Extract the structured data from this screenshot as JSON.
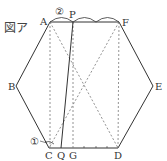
{
  "figure": {
    "title": "図ア",
    "points": {
      "A": "A",
      "B": "B",
      "C": "C",
      "D": "D",
      "E": "E",
      "F": "F",
      "P": "P",
      "Q": "Q",
      "G": "G"
    },
    "markers": {
      "circle1": "①",
      "circle2": "②"
    },
    "colors": {
      "line": "#333333",
      "dashed": "#777777"
    }
  }
}
